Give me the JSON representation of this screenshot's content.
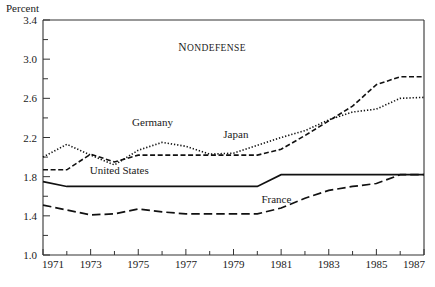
{
  "chart_data": {
    "type": "line",
    "title": "Nondefense",
    "ylabel": "Percent",
    "xlabel": "",
    "ylim": [
      1.0,
      3.4
    ],
    "xlim": [
      1971,
      1987
    ],
    "grid": false,
    "legend_position": "inline-annotations",
    "y_ticks_major": [
      "1.0",
      "1.4",
      "1.8",
      "2.2",
      "2.6",
      "3.0",
      "3.4"
    ],
    "y_ticks_major_values": [
      1.0,
      1.4,
      1.8,
      2.2,
      2.6,
      3.0,
      3.4
    ],
    "y_ticks_minor_values": [
      1.2,
      1.6,
      2.0,
      2.4,
      2.8,
      3.2
    ],
    "x_ticks_major": [
      "1971",
      "1973",
      "1975",
      "1977",
      "1979",
      "1981",
      "1983",
      "1985",
      "1987"
    ],
    "x_ticks_major_values": [
      1971,
      1973,
      1975,
      1977,
      1979,
      1981,
      1983,
      1985,
      1987
    ],
    "x_ticks_minor_values": [
      1972,
      1974,
      1976,
      1978,
      1980,
      1982,
      1984,
      1986
    ],
    "x": [
      1971,
      1972,
      1973,
      1974,
      1975,
      1976,
      1977,
      1978,
      1979,
      1980,
      1981,
      1982,
      1983,
      1984,
      1985,
      1986,
      1987
    ],
    "series": [
      {
        "name": "Japan",
        "style": "dashed",
        "label": "Japan",
        "label_x": 1979.1,
        "label_y": 2.2,
        "values": [
          1.87,
          1.87,
          2.03,
          1.95,
          2.02,
          2.02,
          2.02,
          2.02,
          2.02,
          2.02,
          2.08,
          2.22,
          2.37,
          2.52,
          2.74,
          2.82,
          2.82
        ]
      },
      {
        "name": "Germany",
        "style": "dotted",
        "label": "Germany",
        "label_x": 1975.6,
        "label_y": 2.32,
        "values": [
          2.0,
          2.13,
          2.02,
          1.92,
          2.07,
          2.15,
          2.11,
          2.03,
          2.04,
          2.12,
          2.2,
          2.27,
          2.38,
          2.46,
          2.49,
          2.6,
          2.61
        ]
      },
      {
        "name": "United States",
        "style": "solid",
        "label": "United States",
        "label_x": 1974.2,
        "label_y": 1.83,
        "values": [
          1.75,
          1.7,
          1.7,
          1.7,
          1.7,
          1.7,
          1.7,
          1.7,
          1.7,
          1.7,
          1.82,
          1.82,
          1.82,
          1.82,
          1.82,
          1.82,
          1.82
        ]
      },
      {
        "name": "France",
        "style": "long-dashed",
        "label": "France",
        "label_x": 1980.8,
        "label_y": 1.53,
        "values": [
          1.51,
          1.46,
          1.41,
          1.42,
          1.47,
          1.44,
          1.42,
          1.42,
          1.42,
          1.42,
          1.48,
          1.58,
          1.66,
          1.7,
          1.73,
          1.82,
          1.82
        ]
      }
    ]
  }
}
